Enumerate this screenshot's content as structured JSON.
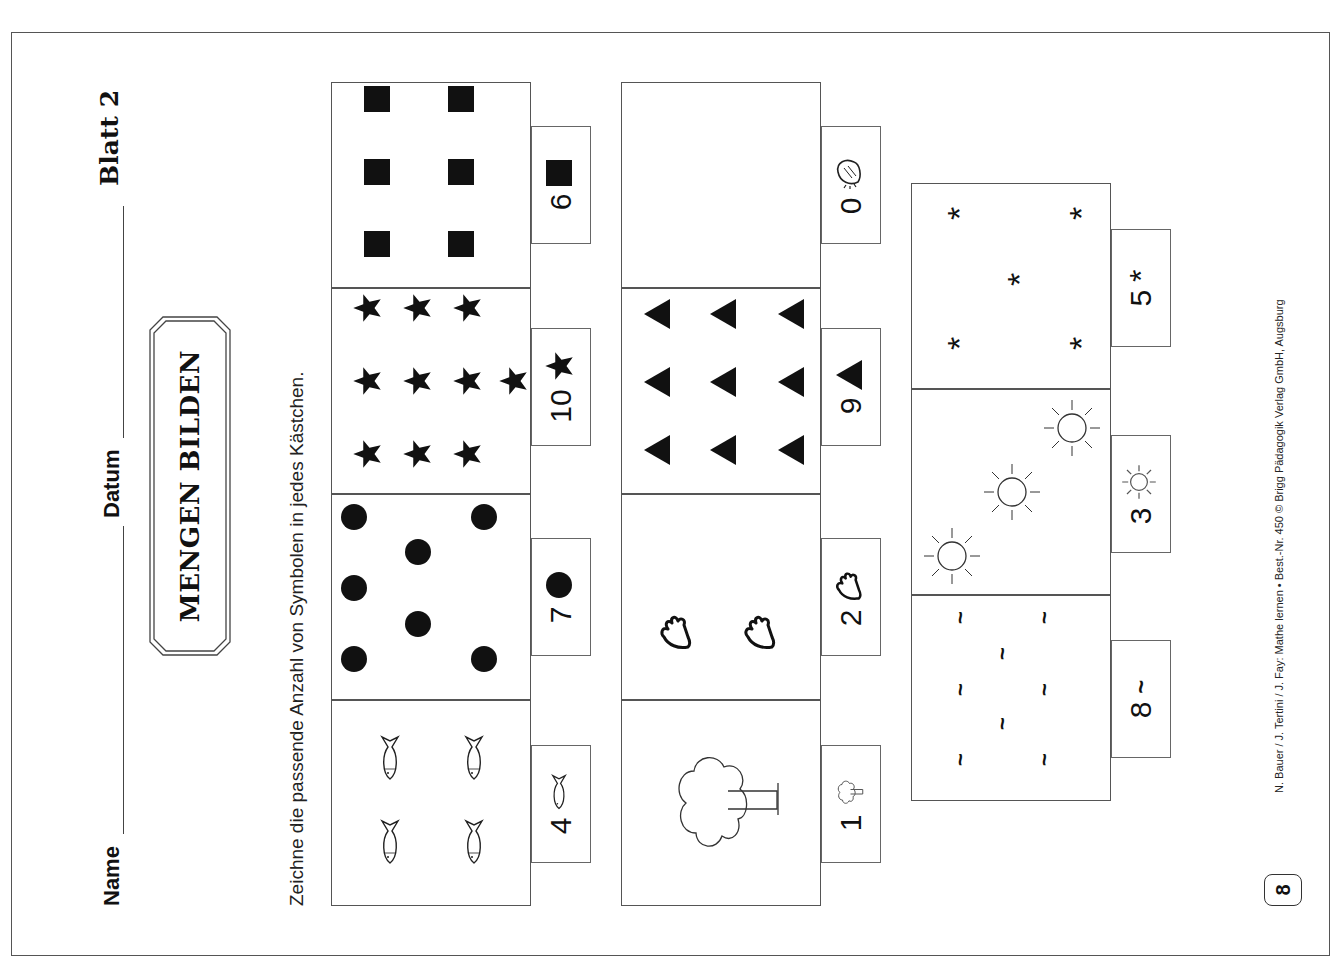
{
  "header": {
    "name_label": "Name",
    "date_label": "Datum",
    "sheet_label": "Blatt 2"
  },
  "title": "MENGEN BILDEN",
  "instruction": "Zeichne die passende Anzahl von Symbolen in jedes Kästchen.",
  "columns": [
    {
      "cells": [
        {
          "count": "4",
          "symbol": "fish-icon",
          "drawn": 4
        },
        {
          "count": "7",
          "symbol": "circle-icon",
          "drawn": 7
        },
        {
          "count": "10",
          "symbol": "star-icon",
          "drawn": 10
        },
        {
          "count": "6",
          "symbol": "square-icon",
          "drawn": 6
        }
      ]
    },
    {
      "cells": [
        {
          "count": "1",
          "symbol": "tree-icon",
          "drawn": 1
        },
        {
          "count": "2",
          "symbol": "hand-icon",
          "drawn": 2
        },
        {
          "count": "9",
          "symbol": "triangle-icon",
          "drawn": 9
        },
        {
          "count": "0",
          "symbol": "bread-icon",
          "drawn": 0
        }
      ]
    },
    {
      "cells": [
        {
          "count": "8",
          "symbol": "tilde-icon",
          "drawn": 8
        },
        {
          "count": "3",
          "symbol": "sun-icon",
          "drawn": 3
        },
        {
          "count": "5",
          "symbol": "asterisk-icon",
          "drawn": 5
        }
      ]
    }
  ],
  "footer": {
    "credit": "N. Bauer / J. Tertini / J. Fay: Mathe lernen • Best.-Nr. 450 © Brigg Pädagogik Verlag GmbH, Augsburg",
    "page_number": "8"
  }
}
